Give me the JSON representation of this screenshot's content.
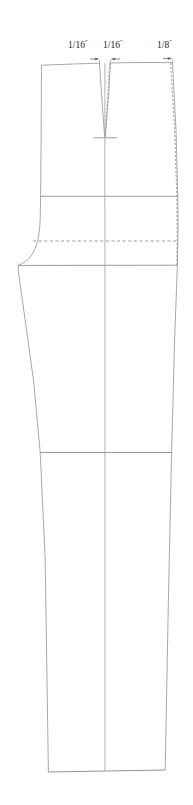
{
  "diagram": {
    "type": "pattern-drafting-line-diagram",
    "background_color": "#ffffff",
    "line_color": "#8c8c8c",
    "accent_line_color": "#6e6e6e",
    "text_color": "#1b1b1b",
    "annotations": [
      {
        "id": "left-dart",
        "value": "1/16",
        "unit": "″",
        "position": "above center-front dart, left side"
      },
      {
        "id": "right-dart",
        "value": "1/16",
        "unit": "″",
        "position": "above center-front dart, right side"
      },
      {
        "id": "side-seam",
        "value": "1/8",
        "unit": "″",
        "position": "above right side seam"
      }
    ],
    "construction_lines": [
      {
        "name": "waistline",
        "orientation": "horizontal",
        "style": "solid"
      },
      {
        "name": "dart-point-tick",
        "orientation": "horizontal",
        "style": "solid"
      },
      {
        "name": "yoke-line",
        "orientation": "horizontal",
        "style": "solid"
      },
      {
        "name": "hipline",
        "orientation": "horizontal",
        "style": "dashed"
      },
      {
        "name": "crotch-line",
        "orientation": "horizontal",
        "style": "solid"
      },
      {
        "name": "knee-line",
        "orientation": "horizontal",
        "style": "solid"
      },
      {
        "name": "grainline",
        "orientation": "vertical",
        "style": "solid"
      },
      {
        "name": "hemline",
        "orientation": "horizontal",
        "style": "solid"
      }
    ],
    "shaped_edges": [
      {
        "name": "center-front-dart",
        "style": "solid-plus-dashed-overlay"
      },
      {
        "name": "side-seam-original",
        "style": "solid"
      },
      {
        "name": "side-seam-adjusted",
        "style": "dashed"
      },
      {
        "name": "crotch-curve",
        "style": "solid-curve"
      },
      {
        "name": "inseam",
        "style": "solid"
      }
    ]
  }
}
